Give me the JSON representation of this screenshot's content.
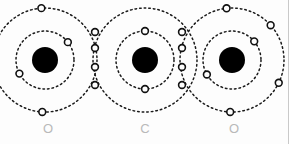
{
  "figure": {
    "background_color": "#fdfdfd",
    "stroke_color": "#1a1a1a",
    "nucleus_color": "#000000",
    "label_color": "#b9b9b9",
    "border_color": "#c9c9c9",
    "width": 289,
    "height": 144
  },
  "atoms": [
    {
      "symbol": "O",
      "name": "oxygen-left",
      "label_x": 36,
      "label_y": 122,
      "center_x": 45,
      "center_y": 60,
      "nucleus_radius": 13,
      "inner_shell_radius": 29,
      "outer_shell_radius": 52,
      "inner_electrons": [
        {
          "angle": -38,
          "shell": "inner"
        },
        {
          "angle": 152,
          "shell": "inner"
        }
      ],
      "outer_electrons": [
        {
          "angle": -94,
          "shell": "outer"
        },
        {
          "angle": 93,
          "shell": "outer"
        },
        {
          "angle": 172,
          "shell": "outer"
        },
        {
          "angle": 196,
          "shell": "outer"
        }
      ]
    },
    {
      "symbol": "C",
      "name": "carbon-center",
      "label_x": 133,
      "label_y": 122,
      "center_x": 145,
      "center_y": 60,
      "nucleus_radius": 13,
      "inner_shell_radius": 29,
      "outer_shell_radius": 52,
      "inner_electrons": [
        {
          "angle": -90,
          "shell": "inner"
        },
        {
          "angle": 90,
          "shell": "inner"
        }
      ],
      "outer_electrons": []
    },
    {
      "symbol": "O",
      "name": "oxygen-right",
      "label_x": 222,
      "label_y": 122,
      "center_x": 232,
      "center_y": 60,
      "nucleus_radius": 13,
      "inner_shell_radius": 29,
      "outer_shell_radius": 52,
      "inner_electrons": [
        {
          "angle": -40,
          "shell": "inner"
        },
        {
          "angle": 150,
          "shell": "inner"
        }
      ],
      "outer_electrons": [
        {
          "angle": -96,
          "shell": "outer"
        },
        {
          "angle": 92,
          "shell": "outer"
        },
        {
          "angle": -42,
          "shell": "outer"
        },
        {
          "angle": 26,
          "shell": "outer"
        }
      ]
    }
  ],
  "bonds": [
    {
      "name": "bond-left",
      "type": "double-bond",
      "between": [
        "oxygen-left",
        "carbon-center"
      ],
      "x": 95,
      "shared_electrons": [
        {
          "x": 95,
          "y": 32
        },
        {
          "x": 95,
          "y": 48
        },
        {
          "x": 95,
          "y": 67
        },
        {
          "x": 95,
          "y": 85
        }
      ]
    },
    {
      "name": "bond-right",
      "type": "double-bond",
      "between": [
        "carbon-center",
        "oxygen-right"
      ],
      "x": 182,
      "shared_electrons": [
        {
          "x": 182,
          "y": 32
        },
        {
          "x": 182,
          "y": 48
        },
        {
          "x": 182,
          "y": 67
        },
        {
          "x": 182,
          "y": 85
        }
      ]
    }
  ],
  "electron_marker": {
    "radius": 3.4,
    "fill": "#fdfdfd",
    "stroke": "#111111",
    "stroke_width": 1.6
  },
  "shell_style": {
    "stroke": "#1a1a1a",
    "stroke_width": 1.5,
    "dash_array": "1.6 3.0"
  },
  "chart_data": {
    "type": "diagram",
    "molecule": "CO2",
    "atom_symbols": [
      "O",
      "C",
      "O"
    ],
    "shells_per_atom": 2,
    "inner_shell_electrons_per_atom": [
      2,
      2,
      2
    ],
    "bond_order": [
      2,
      2
    ],
    "shared_electrons_per_bond": [
      4,
      4
    ],
    "annotations": [
      "O",
      "C",
      "O"
    ]
  }
}
